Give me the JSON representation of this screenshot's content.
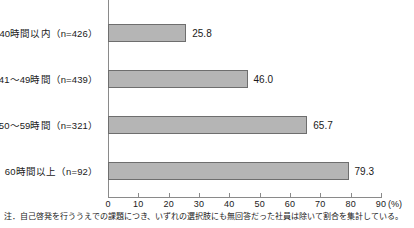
{
  "chart_data": {
    "type": "bar",
    "orientation": "horizontal",
    "title": "",
    "xlabel": "(%)",
    "ylabel": "",
    "xlim": [
      0,
      90
    ],
    "xticks": [
      0,
      10,
      20,
      30,
      40,
      50,
      60,
      70,
      80,
      90
    ],
    "grid": false,
    "legend": null,
    "categories": [
      "40時間以内（n=426）",
      "41〜49時間（n=439）",
      "50〜59時間（n=321）",
      "60時間以上（n=92）"
    ],
    "values": [
      25.8,
      46.0,
      65.7,
      79.3
    ],
    "value_labels": [
      "25.8",
      "46.0",
      "65.7",
      "79.3"
    ],
    "tick_labels": [
      "0",
      "10",
      "20",
      "30",
      "40",
      "50",
      "60",
      "70",
      "80",
      "90"
    ],
    "unit_label": "(%)",
    "bar_color": "#b5b5b5",
    "bar_border_color": "#6e6e6e",
    "axis_color": "#8a8a8a"
  },
  "footnote": {
    "text": "注．自己啓発を行ううえでの課題につき、いずれの選択肢にも無回答だった社員は除いて割合を集計している。"
  }
}
